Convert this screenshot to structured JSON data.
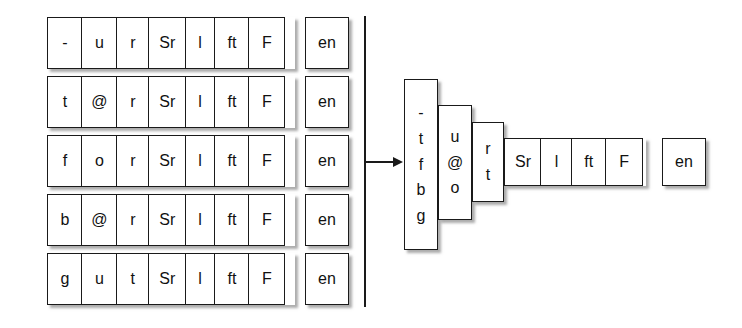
{
  "diagram": {
    "colors": {
      "ink": "#1a1a1a",
      "box_fill": "#ffffff",
      "shadow": "#5a5a5a",
      "background": "#ffffff"
    },
    "left": {
      "rows": [
        {
          "cells": [
            "-",
            "u",
            "r",
            "Sr",
            "l",
            "ft",
            "F"
          ],
          "tag": "en"
        },
        {
          "cells": [
            "t",
            "@",
            "r",
            "Sr",
            "l",
            "ft",
            "F"
          ],
          "tag": "en"
        },
        {
          "cells": [
            "f",
            "o",
            "r",
            "Sr",
            "l",
            "ft",
            "F"
          ],
          "tag": "en"
        },
        {
          "cells": [
            "b",
            "@",
            "r",
            "Sr",
            "l",
            "ft",
            "F"
          ],
          "tag": "en"
        },
        {
          "cells": [
            "g",
            "u",
            "t",
            "Sr",
            "l",
            "ft",
            "F"
          ],
          "tag": "en"
        }
      ]
    },
    "connector": {
      "separator": "vertical-rule",
      "arrow": "right-arrow"
    },
    "right": {
      "stacks": [
        {
          "glyphs": [
            "-",
            "t",
            "f",
            "b",
            "g"
          ]
        },
        {
          "glyphs": [
            "u",
            "@",
            "o"
          ]
        },
        {
          "glyphs": [
            "r",
            "t"
          ]
        }
      ],
      "suffix_cells": [
        "Sr",
        "l",
        "ft",
        "F"
      ],
      "tag": "en"
    }
  }
}
